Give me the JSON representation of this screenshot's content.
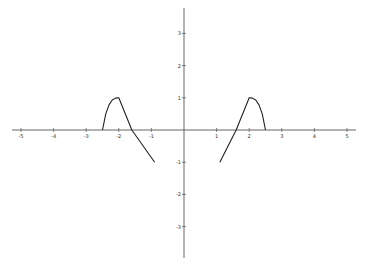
{
  "chart_data": {
    "type": "line",
    "title": "",
    "xlabel": "",
    "ylabel": "",
    "xlim": [
      -5.2,
      5.2
    ],
    "ylim": [
      -3.8,
      3.8
    ],
    "grid": false,
    "legend": null,
    "x_ticks": [
      -5,
      -4,
      -3,
      -2,
      -1,
      1,
      2,
      3,
      4,
      5
    ],
    "y_ticks": [
      3,
      2,
      1,
      -1,
      -2,
      -3
    ],
    "series": [
      {
        "name": "left-branch",
        "points": [
          [
            -2.5,
            0
          ],
          [
            -2.4,
            0.5
          ],
          [
            -2.3,
            0.78
          ],
          [
            -2.2,
            0.93
          ],
          [
            -2.1,
            0.99
          ],
          [
            -2.0,
            1.0
          ],
          [
            -1.6,
            0.0
          ],
          [
            -0.9,
            -1.0
          ]
        ]
      },
      {
        "name": "right-branch",
        "points": [
          [
            1.1,
            -1.0
          ],
          [
            1.6,
            0.0
          ],
          [
            2.0,
            1.0
          ],
          [
            2.1,
            0.99
          ],
          [
            2.2,
            0.93
          ],
          [
            2.3,
            0.78
          ],
          [
            2.4,
            0.5
          ],
          [
            2.5,
            0
          ]
        ]
      }
    ],
    "color": "#222222"
  },
  "axes": {
    "color": "#555555",
    "x_tick_labels": [
      "-5",
      "-4",
      "-3",
      "-2",
      "-1",
      "1",
      "2",
      "3",
      "4",
      "5"
    ],
    "y_tick_labels": [
      "3",
      "2",
      "1",
      "-1",
      "-2",
      "-3"
    ]
  }
}
